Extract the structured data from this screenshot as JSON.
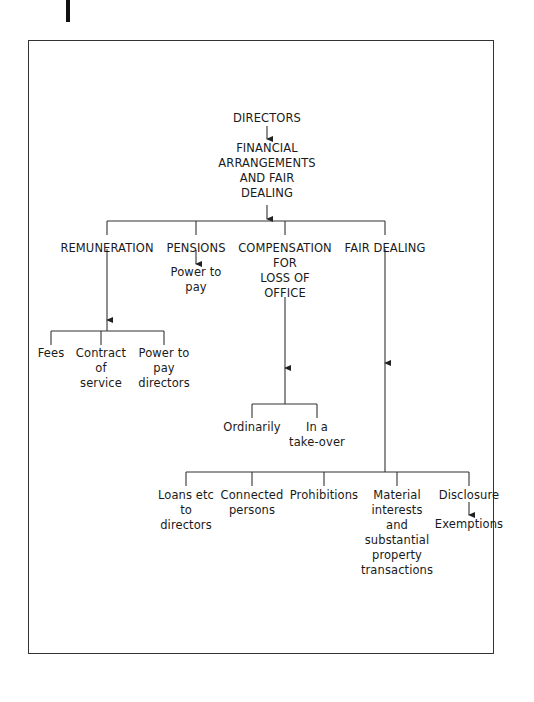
{
  "diagram": {
    "root": "DIRECTORS",
    "subtitle": [
      "FINANCIAL",
      "ARRANGEMENTS",
      "AND FAIR",
      "DEALING"
    ],
    "branches": {
      "remuneration": {
        "label": "REMUNERATION",
        "children": {
          "fees": [
            "Fees"
          ],
          "contract": [
            "Contract",
            "of",
            "service"
          ],
          "power": [
            "Power to",
            "pay",
            "directors"
          ]
        }
      },
      "pensions": {
        "label": "PENSIONS",
        "child": [
          "Power to",
          "pay"
        ]
      },
      "compensation": {
        "label": [
          "COMPENSATION",
          "FOR",
          "LOSS OF",
          "OFFICE"
        ],
        "children": {
          "ordinarily": [
            "Ordinarily"
          ],
          "takeover": [
            "In a",
            "take-over"
          ]
        }
      },
      "fair_dealing": {
        "label": "FAIR DEALING",
        "children": {
          "loans": [
            "Loans etc",
            "to",
            "directors"
          ],
          "connected": [
            "Connected",
            "persons"
          ],
          "prohibitions": [
            "Prohibitions"
          ],
          "material": [
            "Material",
            "interests",
            "and",
            "substantial",
            "property",
            "transactions"
          ],
          "disclosure": [
            "Disclosure"
          ],
          "exemptions": [
            "Exemptions"
          ]
        }
      }
    }
  }
}
